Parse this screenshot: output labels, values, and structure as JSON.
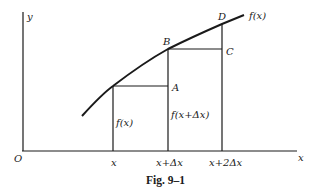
{
  "figure": {
    "caption": "Fig. 9–1",
    "axes": {
      "x_label": "x",
      "y_label": "y",
      "origin_label": "O"
    },
    "curve_label": "f(x)",
    "points": {
      "A": "A",
      "B": "B",
      "C": "C",
      "D": "D"
    },
    "ticks": [
      "x",
      "x+Δx",
      "x+2Δx"
    ],
    "segment_labels": {
      "f_x": "f(x)",
      "f_x_dx": "f(x+Δx)"
    }
  }
}
